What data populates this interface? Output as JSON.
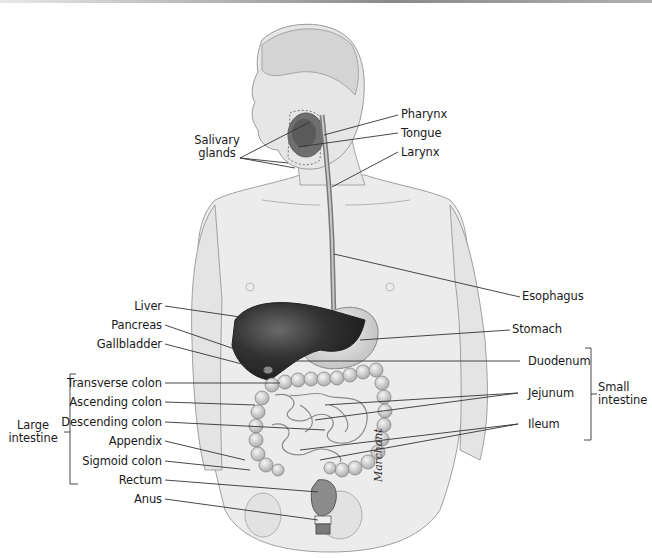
{
  "figure": {
    "signature": "Marchant"
  },
  "labels": {
    "pharynx": "Pharynx",
    "tongue": "Tongue",
    "larynx": "Larynx",
    "salivary_glands_line1": "Salivary",
    "salivary_glands_line2": "glands",
    "esophagus": "Esophagus",
    "liver": "Liver",
    "pancreas": "Pancreas",
    "gallbladder": "Gallbladder",
    "stomach": "Stomach",
    "duodenum": "Duodenum",
    "transverse_colon": "Transverse colon",
    "ascending_colon": "Ascending colon",
    "descending_colon": "Descending colon",
    "appendix": "Appendix",
    "sigmoid_colon": "Sigmoid colon",
    "rectum": "Rectum",
    "anus": "Anus",
    "jejunum": "Jejunum",
    "ileum": "Ileum"
  },
  "groups": {
    "large_intestine_line1": "Large",
    "large_intestine_line2": "intestine",
    "small_intestine_line1": "Small",
    "small_intestine_line2": "intestine"
  },
  "colors": {
    "body_fill": "#ececec",
    "body_outline": "#9a9a9a",
    "liver": "#2e2e2e",
    "stomach": "#dcdcdc",
    "intestine": "#cfcfcf",
    "leader_line": "#333333",
    "text": "#1a1a1a"
  }
}
